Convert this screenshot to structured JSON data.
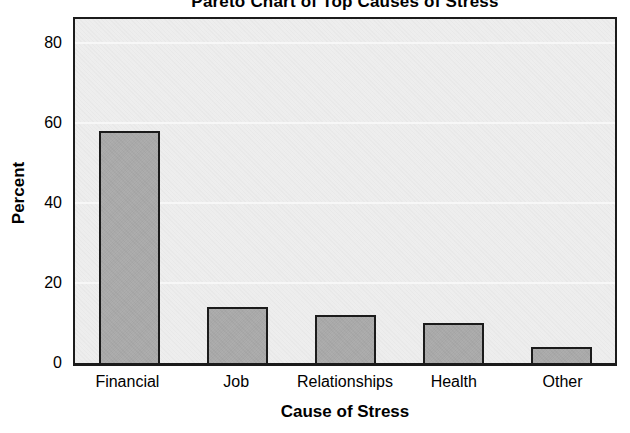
{
  "chart_data": {
    "type": "bar",
    "title": "Pareto Chart of Top Causes of Stress",
    "xlabel": "Cause of Stress",
    "ylabel": "Percent",
    "categories": [
      "Financial",
      "Job",
      "Relationships",
      "Health",
      "Other"
    ],
    "values": [
      58,
      14,
      12,
      10,
      4
    ],
    "yticks": [
      0,
      20,
      40,
      60,
      80
    ],
    "ylim": [
      0,
      86
    ],
    "grid": true,
    "legend_position": "none",
    "colors": {
      "page_bg": "#ffffff",
      "plot_bg": "#ededed",
      "plot_border": "#1b1b1b",
      "bar_fill": "#a9a9a9",
      "bar_border": "#1b1b1b",
      "gridline": "#f7f7f7",
      "text": "#000000"
    }
  }
}
